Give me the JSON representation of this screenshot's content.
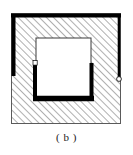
{
  "figure": {
    "caption": "( b )",
    "label": "b",
    "colors": {
      "line": "#000000",
      "hatch": "#7d7d7d",
      "fill": "#ffffff",
      "thin_border": "#555555",
      "background": "#ffffff"
    },
    "outer_region": {
      "name": "hatched-section-region",
      "x": 11,
      "y": 13,
      "width": 110,
      "height": 111,
      "hatch_pattern": "diagonal-45-up-right",
      "hatch_spacing": 5,
      "hatch_line_width": 1
    },
    "inner_region": {
      "name": "inner-white-square",
      "x": 36,
      "y": 38,
      "width": 55,
      "height": 59,
      "fill": "#ffffff",
      "thin_border_width": 1
    },
    "thick_lines": [
      {
        "name": "top-thick-line",
        "x1": 12,
        "y1": 15,
        "x2": 120,
        "y2": 15,
        "width": 4
      },
      {
        "name": "left-thick-line",
        "x1": 13,
        "y1": 15,
        "x2": 13,
        "y2": 76,
        "width": 4
      },
      {
        "name": "inner-left-thick-line",
        "x1": 35,
        "y1": 63,
        "x2": 35,
        "y2": 99,
        "width": 4
      },
      {
        "name": "inner-bottom-thick-line",
        "x1": 33,
        "y1": 98,
        "x2": 93,
        "y2": 98,
        "width": 5
      },
      {
        "name": "inner-right-thick-line",
        "x1": 91,
        "y1": 63,
        "x2": 91,
        "y2": 99,
        "width": 4
      },
      {
        "name": "outer-right-thick-line",
        "x1": 119,
        "y1": 15,
        "x2": 119,
        "y2": 79,
        "width": 3
      }
    ],
    "node_markers": [
      {
        "name": "left-node-marker",
        "cx": 35,
        "cy": 63,
        "r": 2.1,
        "shape": "square"
      },
      {
        "name": "right-node-marker",
        "cx": 119,
        "cy": 79,
        "r": 2.3,
        "shape": "circle"
      }
    ]
  }
}
